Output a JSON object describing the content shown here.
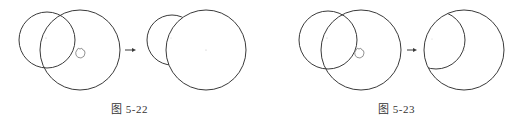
{
  "figures": [
    {
      "id": "fig-5-22",
      "caption": "图 5-22",
      "before": {
        "circles": [
          {
            "cx": 47,
            "cy": 40,
            "r": 28
          },
          {
            "cx": 80,
            "cy": 50,
            "r": 40
          }
        ],
        "cursor": {
          "x": 80,
          "y": 53
        }
      },
      "arrow": {
        "x1": 125,
        "x2": 136,
        "y": 50
      },
      "after": {
        "description": "small circle trimmed inside large circle",
        "large_circle": {
          "cx": 206,
          "cy": 50,
          "r": 40
        },
        "small_circle_visible_arc": {
          "cx": 172,
          "cy": 40,
          "r": 25
        }
      }
    },
    {
      "id": "fig-5-23",
      "caption": "图 5-23",
      "before": {
        "circles": [
          {
            "cx": 328,
            "cy": 40,
            "r": 29
          },
          {
            "cx": 361,
            "cy": 50,
            "r": 40
          }
        ],
        "cursor": {
          "x": 359,
          "y": 53
        }
      },
      "arrow": {
        "x1": 407,
        "x2": 417,
        "y": 50
      },
      "after": {
        "description": "small circle trimmed outside large circle",
        "large_circle": {
          "cx": 464,
          "cy": 50,
          "r": 40
        },
        "small_circle_visible_arc": {
          "cx": 436,
          "cy": 40,
          "r": 29
        }
      }
    }
  ],
  "colors": {
    "stroke": "#3a3a3a",
    "cursor": "#777777",
    "center_mark": "#bbbbbb",
    "caption": "#333333"
  }
}
